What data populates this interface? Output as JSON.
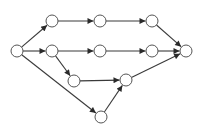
{
  "diagram": {
    "type": "directed-graph",
    "width": 210,
    "height": 129,
    "colors": {
      "edge": "#3a3a3a",
      "node_stroke": "#555555",
      "node_fill": "#ffffff",
      "background": "#ffffff"
    },
    "node_radius": 6,
    "nodes": [
      {
        "id": "S",
        "x": 17,
        "y": 51
      },
      {
        "id": "A1",
        "x": 52,
        "y": 21
      },
      {
        "id": "A2",
        "x": 100,
        "y": 21
      },
      {
        "id": "A3",
        "x": 152,
        "y": 21
      },
      {
        "id": "B1",
        "x": 52,
        "y": 51
      },
      {
        "id": "B2",
        "x": 100,
        "y": 51
      },
      {
        "id": "B3",
        "x": 152,
        "y": 51
      },
      {
        "id": "C",
        "x": 74,
        "y": 81
      },
      {
        "id": "D",
        "x": 126,
        "y": 80
      },
      {
        "id": "E",
        "x": 101,
        "y": 117
      },
      {
        "id": "T",
        "x": 186,
        "y": 51
      }
    ],
    "edges": [
      {
        "from": "S",
        "to": "A1"
      },
      {
        "from": "S",
        "to": "B1"
      },
      {
        "from": "S",
        "to": "E"
      },
      {
        "from": "A1",
        "to": "A2"
      },
      {
        "from": "A2",
        "to": "A3"
      },
      {
        "from": "A3",
        "to": "T"
      },
      {
        "from": "B1",
        "to": "B2"
      },
      {
        "from": "B2",
        "to": "B3"
      },
      {
        "from": "B3",
        "to": "T"
      },
      {
        "from": "B1",
        "to": "C"
      },
      {
        "from": "C",
        "to": "D"
      },
      {
        "from": "E",
        "to": "D"
      },
      {
        "from": "D",
        "to": "T"
      }
    ]
  }
}
